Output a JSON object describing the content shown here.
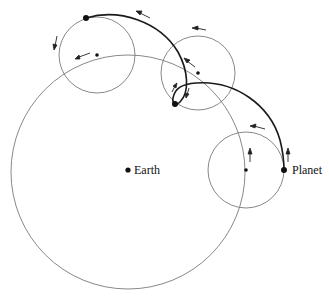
{
  "diagram": {
    "labels": {
      "earth": "Earth",
      "planet": "Planet"
    },
    "colors": {
      "background": "#ffffff",
      "thin_line": "#7a7a7a",
      "path_line": "#1a1a1a",
      "dot": "#111111"
    },
    "deferent": {
      "cx": 128,
      "cy": 172,
      "r": 117
    },
    "epicycles": [
      {
        "name": "upper-left",
        "cx": 97,
        "cy": 55,
        "r": 38
      },
      {
        "name": "middle",
        "cx": 198,
        "cy": 73,
        "r": 37
      },
      {
        "name": "right",
        "cx": 246,
        "cy": 170,
        "r": 38
      }
    ],
    "planet_positions": [
      {
        "x": 86,
        "y": 18
      },
      {
        "x": 175,
        "y": 104
      },
      {
        "x": 284,
        "y": 170
      }
    ],
    "earth_position": {
      "x": 128,
      "y": 170
    }
  }
}
